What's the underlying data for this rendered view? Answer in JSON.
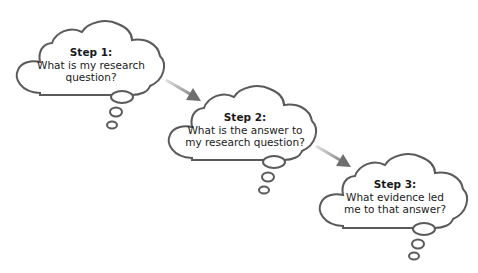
{
  "diagram": {
    "type": "flow",
    "steps": [
      {
        "title": "Step 1:",
        "lines": [
          "What is my research",
          "question?"
        ]
      },
      {
        "title": "Step 2:",
        "lines": [
          "What is the answer to",
          "my research question?"
        ]
      },
      {
        "title": "Step 3:",
        "lines": [
          "What evidence led",
          "me to that answer?"
        ]
      }
    ],
    "edges": [
      {
        "from": 0,
        "to": 1
      },
      {
        "from": 1,
        "to": 2
      }
    ],
    "colors": {
      "outline": "#5a5a5a",
      "arrow_start": "#d8d8d8",
      "arrow_end": "#6e6e6e",
      "text": "#1a1a1a",
      "background": "#ffffff"
    }
  }
}
